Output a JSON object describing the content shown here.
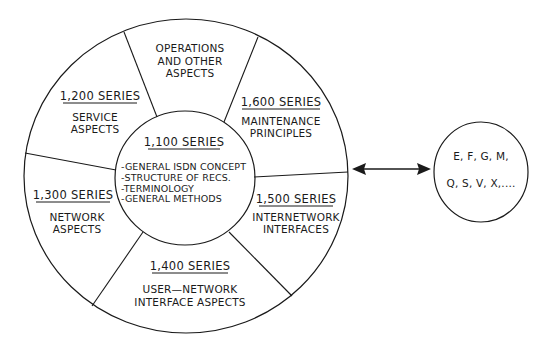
{
  "diagram": {
    "type": "nested-circle-segment-diagram",
    "stroke_color": "#1a1a1a",
    "background": "#ffffff",
    "center_circle": {
      "series": "1,100 SERIES",
      "items": [
        "-GENERAL ISDN CONCEPT",
        "-STRUCTURE OF RECS.",
        "-TERMINOLOGY",
        "-GENERAL METHODS"
      ]
    },
    "segments": [
      {
        "series": "",
        "lines": [
          "OPERATIONS",
          "AND OTHER",
          "ASPECTS"
        ]
      },
      {
        "series": "1,600 SERIES",
        "lines": [
          "MAINTENANCE",
          "PRINCIPLES"
        ]
      },
      {
        "series": "1,500 SERIES",
        "lines": [
          "INTERNETWORK",
          "INTERFACES"
        ]
      },
      {
        "series": "1,400 SERIES",
        "lines": [
          "USER—NETWORK",
          "INTERFACE ASPECTS"
        ]
      },
      {
        "series": "1,300 SERIES",
        "lines": [
          "NETWORK",
          "ASPECTS"
        ]
      },
      {
        "series": "1,200 SERIES",
        "lines": [
          "SERVICE",
          "ASPECTS"
        ]
      }
    ],
    "connector": {
      "type": "double-headed-arrow"
    },
    "external_circle": {
      "lines": [
        "E, F, G, M,",
        "Q, S, V, X,...."
      ]
    }
  }
}
